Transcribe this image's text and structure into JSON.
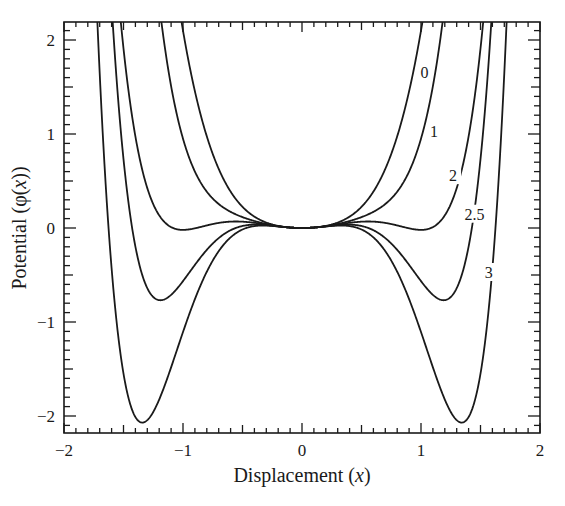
{
  "chart_data": {
    "type": "line",
    "title": "",
    "xlabel": "Displacement (x)",
    "ylabel": "Potential (φ(x))",
    "xlim": [
      -2,
      2
    ],
    "ylim": [
      -2.2,
      2.2
    ],
    "x_ticks": [
      -2,
      -1,
      0,
      1,
      2
    ],
    "x_tick_labels": [
      "−2",
      "−1",
      "0",
      "1",
      "2"
    ],
    "y_ticks": [
      -2,
      -1,
      0,
      1,
      2
    ],
    "y_tick_labels": [
      "−2",
      "−1",
      "0",
      "1",
      "2"
    ],
    "minor_ticks": 0.1,
    "grid": false,
    "legend": "inline curve labels",
    "model": "phi(x) = 0.5*x^2 - a*x^4 + b*x^6",
    "series": [
      {
        "name": "0",
        "a": -1.6,
        "b": 0.0,
        "label_pos": [
          1.08,
          1.63
        ]
      },
      {
        "name": "1",
        "a": 0.35,
        "b": 0.8,
        "label_pos": [
          1.16,
          1.0
        ]
      },
      {
        "name": "2",
        "a": 1.06,
        "b": 0.54,
        "label_pos": [
          1.32,
          0.53
        ]
      },
      {
        "name": "2.5",
        "a": 1.855,
        "b": 0.79,
        "label_pos": [
          1.45,
          0.12
        ]
      },
      {
        "name": "3",
        "a": 2.47,
        "b": 0.863,
        "label_pos": [
          1.62,
          -0.5
        ]
      }
    ],
    "key_points": {
      "0": {
        "min": [
          0,
          0
        ]
      },
      "1": {
        "min": [
          0,
          0
        ]
      },
      "2": {
        "minima_x": [
          -1.0,
          1.0
        ],
        "minima_y": -0.02
      },
      "2.5": {
        "minima_x": [
          -1.19,
          1.19
        ],
        "minima_y": -0.77
      },
      "3": {
        "minima_x": [
          -1.34,
          1.34
        ],
        "minima_y": -2.07
      }
    }
  }
}
